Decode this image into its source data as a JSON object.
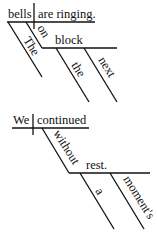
{
  "diagrams": [
    {
      "sentence": "The bells on the next block are ringing.",
      "subject": "bells",
      "predicate": "are ringing.",
      "modifiers": {
        "subject_article": "The",
        "preposition": "on",
        "object": "block",
        "object_article": "the",
        "object_adjective": "next"
      }
    },
    {
      "sentence": "We continued without a moment's rest.",
      "subject": "We",
      "predicate": "continued",
      "modifiers": {
        "preposition": "without",
        "object": "rest.",
        "object_article": "a",
        "object_possessive": "moment's"
      }
    }
  ]
}
